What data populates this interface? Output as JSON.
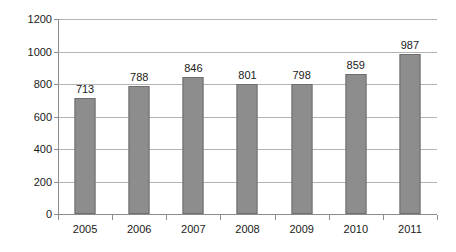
{
  "chart_data": {
    "type": "bar",
    "title": "",
    "subtitle": "",
    "xlabel": "",
    "ylabel": "",
    "categories": [
      "2005",
      "2006",
      "2007",
      "2008",
      "2009",
      "2010",
      "2011"
    ],
    "values": [
      713,
      788,
      846,
      801,
      798,
      859,
      987
    ],
    "data_labels": [
      "713",
      "788",
      "846",
      "801",
      "798",
      "859",
      "987"
    ],
    "ylim": [
      0,
      1200
    ],
    "ytick_labels": [
      "0",
      "200",
      "400",
      "600",
      "800",
      "1000",
      "1200"
    ],
    "ytick_values": [
      0,
      200,
      400,
      600,
      800,
      1000,
      1200
    ],
    "grid": true,
    "grid_axis": "y",
    "legend": false,
    "legend_position": "none",
    "series": [
      {
        "name": "",
        "values": [
          713,
          788,
          846,
          801,
          798,
          859,
          987
        ],
        "color": "#8d8d8d",
        "border_color": "#6e6e6e"
      }
    ],
    "colors": {
      "bar_fill": "#8d8d8d",
      "bar_border": "#6e6e6e",
      "gridline": "#b3b3b3",
      "axis": "#8c8c8c",
      "text": "#1a1a1a",
      "background": "#ffffff"
    }
  }
}
